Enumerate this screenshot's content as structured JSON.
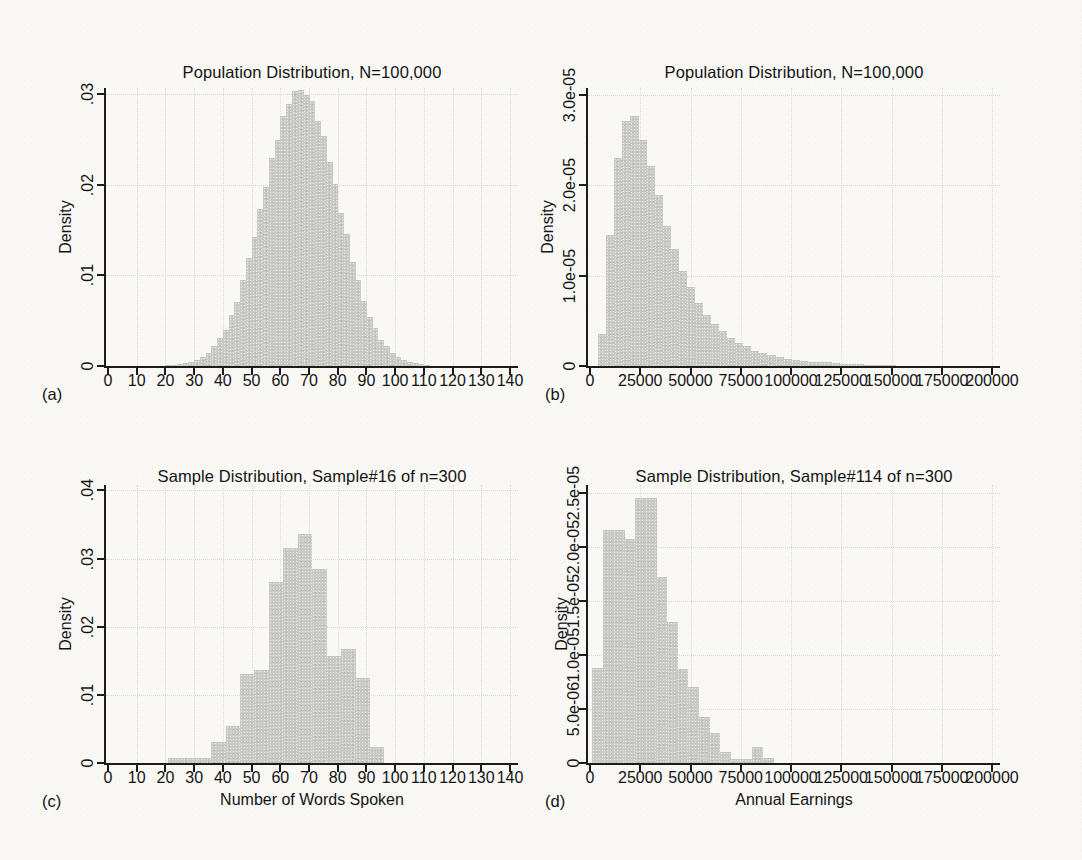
{
  "page": {
    "background": "#f9f8f5",
    "text_color": "#141414",
    "bar_color": "#cbcbc9",
    "grid_color": "#e0dad4",
    "axis_color": "#1b1b1b"
  },
  "chart_data": [
    {
      "id": "a",
      "type": "bar",
      "panel_label": "(a)",
      "title": "Population Distribution, N=100,000",
      "ylabel": "Density",
      "xlabel": "",
      "x_bin_start": 20,
      "bin_width": 2,
      "values": [
        0.0001,
        0.0001,
        0.0002,
        0.0003,
        0.0004,
        0.0007,
        0.001,
        0.0014,
        0.0022,
        0.0031,
        0.004,
        0.0056,
        0.0071,
        0.0095,
        0.0119,
        0.0142,
        0.0173,
        0.0198,
        0.023,
        0.025,
        0.0276,
        0.0289,
        0.0304,
        0.0305,
        0.0299,
        0.0293,
        0.0271,
        0.0254,
        0.0225,
        0.0201,
        0.0169,
        0.0146,
        0.0115,
        0.0095,
        0.0072,
        0.0054,
        0.0042,
        0.0029,
        0.0022,
        0.0014,
        0.001,
        0.0007,
        0.0004,
        0.0003,
        0.0002,
        0.0001
      ],
      "xlim": [
        0,
        140
      ],
      "ylim": [
        0,
        0.0307
      ],
      "xticks": [
        0,
        10,
        20,
        30,
        40,
        50,
        60,
        70,
        80,
        90,
        100,
        110,
        120,
        130,
        140
      ],
      "xtick_labels": [
        "0",
        "10",
        "20",
        "30",
        "40",
        "50",
        "60",
        "70",
        "80",
        "90",
        "100",
        "110",
        "120",
        "130",
        "140"
      ],
      "yticks": [
        0,
        0.01,
        0.02,
        0.03
      ],
      "ytick_labels": [
        "0",
        ".01",
        ".02",
        ".03"
      ],
      "grid": true
    },
    {
      "id": "b",
      "type": "bar",
      "panel_label": "(b)",
      "title": "Population Distribution, N=100,000",
      "ylabel": "Density",
      "xlabel": "",
      "x_bin_start": 0,
      "bin_width": 4000,
      "values": [
        0,
        3.5e-06,
        1.45e-05,
        2.3e-05,
        2.72e-05,
        2.77e-05,
        2.5e-05,
        2.22e-05,
        1.9e-05,
        1.55e-05,
        1.3e-05,
        1.05e-05,
        8.8e-06,
        7e-06,
        5.7e-06,
        4.7e-06,
        3.9e-06,
        3.1e-06,
        2.6e-06,
        2.2e-06,
        1.7e-06,
        1.4e-06,
        1.2e-06,
        1e-06,
        8e-07,
        7e-07,
        6e-07,
        5e-07,
        4e-07,
        4e-07,
        3e-07,
        2e-07,
        2e-07,
        2e-07,
        1e-07,
        1e-07,
        1e-07,
        1e-07
      ],
      "xlim": [
        0,
        200000
      ],
      "ylim": [
        0,
        3.08e-05
      ],
      "xticks": [
        0,
        25000,
        50000,
        75000,
        100000,
        125000,
        150000,
        175000,
        200000
      ],
      "xtick_labels": [
        "0",
        "25000",
        "50000",
        "75000",
        "100000",
        "125000",
        "150000",
        "175000",
        "200000"
      ],
      "yticks": [
        0,
        1e-05,
        2e-05,
        3e-05
      ],
      "ytick_labels": [
        "0",
        "1.0e-05",
        "2.0e-05",
        "3.0e-05"
      ],
      "grid": true
    },
    {
      "id": "c",
      "type": "bar",
      "panel_label": "(c)",
      "title": "Sample Distribution, Sample#16 of n=300",
      "ylabel": "Density",
      "xlabel": "Number of Words Spoken",
      "x_bin_start": 21,
      "bin_width": 5,
      "values": [
        0.0007,
        0.0007,
        0.0007,
        0.0031,
        0.0054,
        0.0131,
        0.0137,
        0.0265,
        0.0315,
        0.0336,
        0.0285,
        0.0157,
        0.0168,
        0.0125,
        0.0024
      ],
      "xlim": [
        0,
        140
      ],
      "ylim": [
        0,
        0.0408
      ],
      "xticks": [
        0,
        10,
        20,
        30,
        40,
        50,
        60,
        70,
        80,
        90,
        100,
        110,
        120,
        130,
        140
      ],
      "xtick_labels": [
        "0",
        "10",
        "20",
        "30",
        "40",
        "50",
        "60",
        "70",
        "80",
        "90",
        "100",
        "110",
        "120",
        "130",
        "140"
      ],
      "yticks": [
        0,
        0.01,
        0.02,
        0.03,
        0.04
      ],
      "ytick_labels": [
        "0",
        ".01",
        ".02",
        ".03",
        ".04"
      ],
      "grid": true
    },
    {
      "id": "d",
      "type": "bar",
      "panel_label": "(d)",
      "title": "Sample Distribution, Sample#114 of n=300",
      "ylabel": "Density",
      "xlabel": "Annual Earnings",
      "x_bin_start": 1000,
      "bin_width": 5300,
      "values": [
        8.8e-06,
        2.15e-05,
        2.15e-05,
        2.07e-05,
        2.45e-05,
        2.45e-05,
        1.72e-05,
        1.3e-05,
        8.7e-06,
        7e-06,
        4.3e-06,
        2.8e-06,
        1e-06,
        4e-07,
        4e-07,
        1.5e-06,
        5e-07
      ],
      "xlim": [
        0,
        200000
      ],
      "ylim": [
        0,
        2.57e-05
      ],
      "xticks": [
        0,
        25000,
        50000,
        75000,
        100000,
        125000,
        150000,
        175000,
        200000
      ],
      "xtick_labels": [
        "0",
        "25000",
        "50000",
        "75000",
        "100000",
        "125000",
        "150000",
        "175000",
        "200000"
      ],
      "yticks": [
        0,
        5e-06,
        1e-05,
        1.5e-05,
        2e-05,
        2.5e-05
      ],
      "ytick_labels": [
        "0",
        "5.0e-06",
        "1.0e-05",
        "1.5e-05",
        "2.0e-05",
        "2.5e-05"
      ],
      "grid": true
    }
  ]
}
